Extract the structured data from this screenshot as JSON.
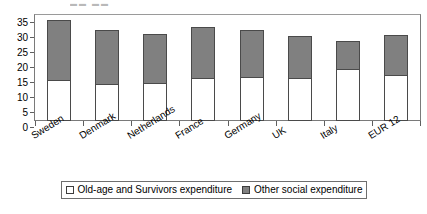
{
  "chart_data": {
    "type": "bar",
    "subtype": "stacked-column",
    "title": "",
    "xlabel": "",
    "ylabel": "",
    "ylim": [
      0,
      35
    ],
    "yticks": [
      0,
      5,
      10,
      15,
      20,
      25,
      30,
      35
    ],
    "grid": false,
    "legend_position": "bottom",
    "categories": [
      "Sweden",
      "Denmark",
      "Netherlands",
      "France",
      "Germany",
      "UK",
      "Italy",
      "EUR 12"
    ],
    "series": [
      {
        "name": "Old-age and Survivors expenditure",
        "color": "#ffffff",
        "values": [
          13.3,
          12.0,
          12.3,
          14.0,
          14.3,
          13.7,
          16.7,
          15.0
        ]
      },
      {
        "name": "Other social expenditure",
        "color": "#808080",
        "values": [
          19.9,
          18.0,
          16.4,
          17.0,
          15.7,
          14.3,
          9.6,
          13.3
        ]
      }
    ],
    "totals": [
      33.2,
      30.0,
      28.7,
      31.0,
      30.0,
      28.0,
      26.3,
      28.3
    ]
  },
  "legend": {
    "items": [
      {
        "label": "Old-age and Survivors expenditure",
        "swatch": "white-square-icon"
      },
      {
        "label": "Other social expenditure",
        "swatch": "gray-square-icon"
      }
    ]
  },
  "axis": {
    "y_tick_labels": [
      "35",
      "30",
      "25",
      "20",
      "15",
      "10",
      "5",
      "0"
    ]
  },
  "clipped_header": "▬▬ ▬▬"
}
